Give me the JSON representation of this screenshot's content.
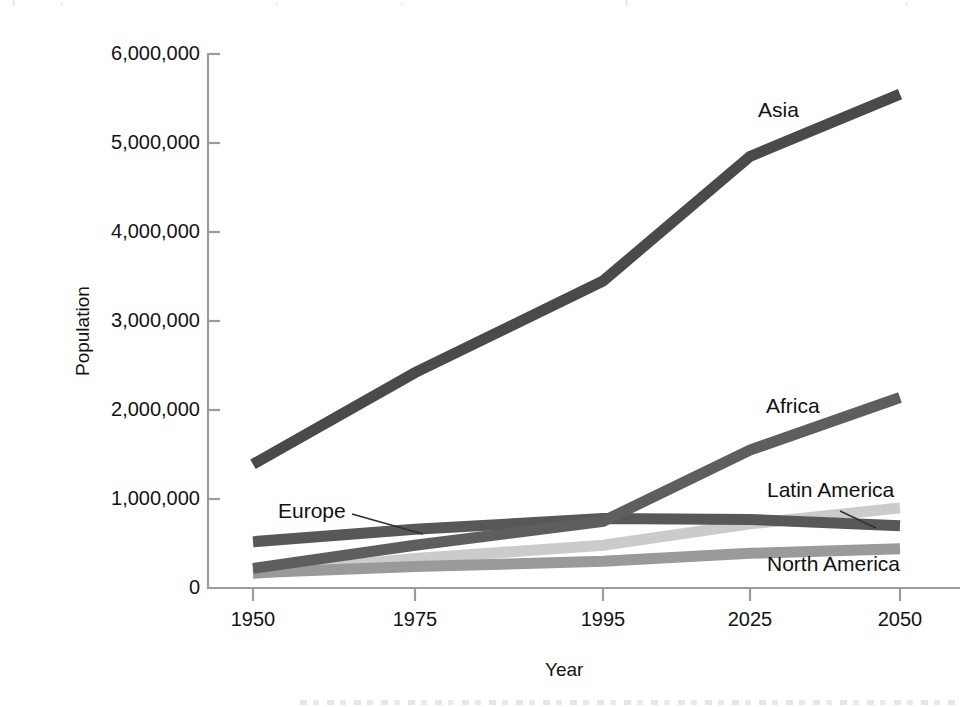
{
  "chart_data": {
    "type": "line",
    "title": "",
    "xlabel": "Year",
    "ylabel": "Population",
    "categories": [
      "1950",
      "1975",
      "1995",
      "2025",
      "2050"
    ],
    "x": [
      1950,
      1975,
      1995,
      2025,
      2050
    ],
    "ylim": [
      0,
      6000000
    ],
    "ytick_values": [
      0,
      1000000,
      2000000,
      3000000,
      4000000,
      5000000,
      6000000
    ],
    "ytick_labels": [
      "0",
      "1,000,000",
      "2,000,000",
      "3,000,000",
      "4,000,000",
      "5,000,000",
      "6,000,000"
    ],
    "xtick_labels": [
      "1950",
      "1975",
      "1995",
      "2025",
      "2050"
    ],
    "grid": false,
    "legend_position": "inline-annotations",
    "axis_style": "open-left-bottom-with-outward-ticks",
    "series": [
      {
        "name": "Asia",
        "color": "#4a4a4a",
        "width": 11,
        "values": [
          1390000,
          2420000,
          3450000,
          4850000,
          5550000
        ]
      },
      {
        "name": "Africa",
        "color": "#5e5e5e",
        "width": 11,
        "values": [
          220000,
          480000,
          750000,
          1550000,
          2140000
        ]
      },
      {
        "name": "Europe",
        "color": "#585858",
        "width": 11,
        "values": [
          520000,
          660000,
          780000,
          770000,
          700000
        ]
      },
      {
        "name": "Latin America",
        "color": "#cbcbcb",
        "width": 11,
        "values": [
          160000,
          330000,
          480000,
          720000,
          900000
        ]
      },
      {
        "name": "North America",
        "color": "#9a9a9a",
        "width": 11,
        "values": [
          170000,
          240000,
          300000,
          390000,
          440000
        ]
      }
    ],
    "annotations": [
      {
        "text": "Asia",
        "leader": false
      },
      {
        "text": "Africa",
        "leader": false
      },
      {
        "text": "Europe",
        "leader": true
      },
      {
        "text": "Latin America",
        "leader": true
      },
      {
        "text": "North America",
        "leader": false
      }
    ]
  },
  "axes": {
    "y_title": "Population",
    "x_title": "Year",
    "y_labels": {
      "t6": "6,000,000",
      "t5": "5,000,000",
      "t4": "4,000,000",
      "t3": "3,000,000",
      "t2": "2,000,000",
      "t1": "1,000,000",
      "t0": "0"
    },
    "x_labels": {
      "c0": "1950",
      "c1": "1975",
      "c2": "1995",
      "c3": "2025",
      "c4": "2050"
    }
  },
  "series_labels": {
    "asia": "Asia",
    "africa": "Africa",
    "europe": "Europe",
    "latin_america": "Latin America",
    "north_america": "North America"
  },
  "colors": {
    "asia": "#4a4a4a",
    "africa": "#5e5e5e",
    "europe": "#585858",
    "latin_america": "#cbcbcb",
    "north_america": "#9a9a9a",
    "axis": "#9b9b9b",
    "text": "#121212",
    "background": "#ffffff"
  },
  "artifact": {
    "top_strip": "| | , , | ,"
  }
}
